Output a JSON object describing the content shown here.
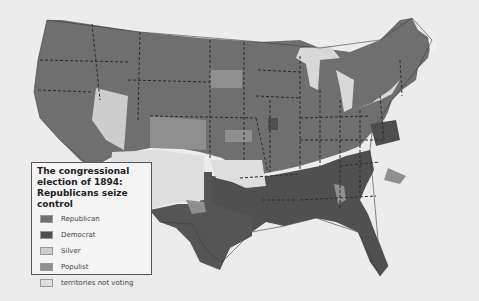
{
  "legend": {
    "title": "The congressional election of 1894: Republicans seize control",
    "items": [
      {
        "label": "Republican",
        "color": "#6f6f6f"
      },
      {
        "label": "Democrat",
        "color": "#4f4f4f"
      },
      {
        "label": "Silver",
        "color": "#cdcdcd"
      },
      {
        "label": "Populist",
        "color": "#8f8f8f"
      },
      {
        "label": "territories not voting",
        "color": "#dedede"
      }
    ]
  },
  "colors": {
    "background": "#ececec",
    "water": "#d8d8d8",
    "border": "#333333"
  }
}
